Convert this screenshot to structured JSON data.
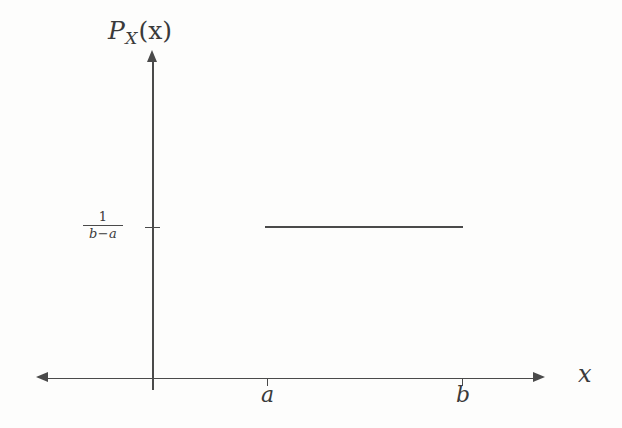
{
  "figure": {
    "background_color": "#fdfdfc",
    "ink_color": "#4a4a4a",
    "axis_label_y": {
      "base": "P",
      "subscript": "X",
      "argument": "(x)"
    },
    "axis_label_x": "x",
    "tick_label_a": "a",
    "tick_label_b": "b",
    "tick_label_density": {
      "numerator": "1",
      "denominator": "b−a"
    }
  },
  "chart_data": {
    "type": "line",
    "title": "",
    "xlabel": "x",
    "ylabel": "P_X(x)",
    "grid": false,
    "legend": null,
    "x_tick_labels": [
      "a",
      "b"
    ],
    "x_tick_positions": [
      0,
      1
    ],
    "y_tick_labels": [
      "1/(b-a)"
    ],
    "y_tick_positions": [
      1
    ],
    "xlim": [
      -1.18,
      1.43
    ],
    "ylim": [
      0,
      1.82
    ],
    "series": [
      {
        "name": "P_X(x)",
        "x": [
          0,
          1
        ],
        "values": [
          1,
          1
        ]
      }
    ],
    "annotations": [
      {
        "text": "P_X(x)",
        "role": "y-axis-label"
      },
      {
        "text": "x",
        "role": "x-axis-label"
      },
      {
        "text": "1/(b-a)",
        "role": "y-tick-label"
      },
      {
        "text": "a",
        "role": "x-tick-label"
      },
      {
        "text": "b",
        "role": "x-tick-label"
      }
    ]
  }
}
